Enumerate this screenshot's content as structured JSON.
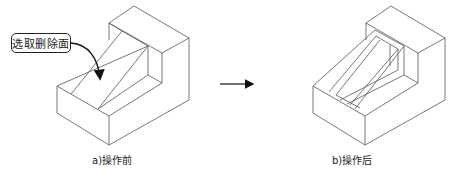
{
  "figure_left": {
    "callout_label": "选取删除面",
    "caption": "a)操作前"
  },
  "figure_right": {
    "caption": "b)操作后"
  },
  "arrow": {
    "meaning": "transition-arrow"
  },
  "colors": {
    "line": "#555555",
    "text": "#222222",
    "background": "#ffffff"
  }
}
